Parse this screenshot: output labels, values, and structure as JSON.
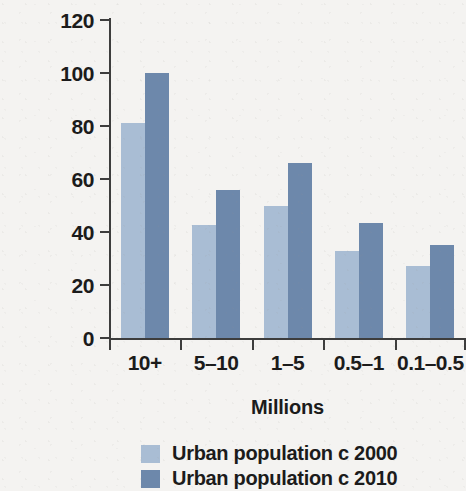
{
  "chart_data": {
    "type": "bar",
    "title": "",
    "xlabel": "Millions",
    "ylabel": "Population (millions)",
    "categories": [
      "10+",
      "5–10",
      "1–5",
      "0.5–1",
      "0.1–0.5"
    ],
    "series": [
      {
        "name": "Urban population c 2000",
        "color": "#a9bdd4",
        "values": [
          81,
          42.5,
          50,
          33,
          27
        ]
      },
      {
        "name": "Urban population c 2010",
        "color": "#6d88ab",
        "values": [
          100,
          56,
          66,
          43.5,
          35
        ]
      }
    ],
    "ylim": [
      0,
      120
    ],
    "yticks": [
      0,
      20,
      40,
      60,
      80,
      100,
      120
    ],
    "ytick_labels": [
      "0",
      "20",
      "40",
      "60",
      "80",
      "100",
      "120"
    ],
    "grid": false,
    "legend_position": "below"
  },
  "axis": {
    "y_title": "Population (millions)",
    "x_title": "Millions"
  },
  "legend": {
    "entries": [
      {
        "label": "Urban population c 2000",
        "swatch": "#a9bdd4"
      },
      {
        "label": "Urban population c 2010",
        "swatch": "#6d88ab"
      }
    ]
  }
}
